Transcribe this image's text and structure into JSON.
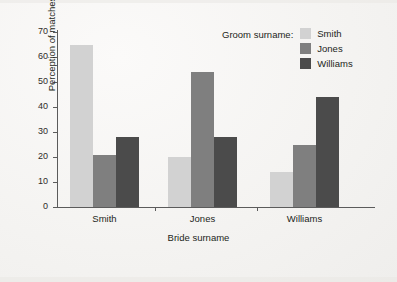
{
  "chart_data": {
    "type": "bar",
    "title": "",
    "xlabel": "Bride surname",
    "ylabel": "Perception of matches",
    "categories": [
      "Smith",
      "Jones",
      "Williams"
    ],
    "series": [
      {
        "name": "Smith",
        "values": [
          65,
          20,
          14
        ],
        "color": "#d2d2d2"
      },
      {
        "name": "Jones",
        "values": [
          21,
          54,
          25
        ],
        "color": "#7f7f7f"
      },
      {
        "name": "Williams",
        "values": [
          28,
          28,
          44
        ],
        "color": "#4b4b4b"
      }
    ],
    "ylim": [
      0,
      70
    ],
    "ytick_labels": [
      "70",
      "60",
      "50",
      "40",
      "30",
      "20",
      "10",
      "0"
    ],
    "ytick_values": [
      70,
      60,
      50,
      40,
      30,
      20,
      10,
      0
    ],
    "grid": false,
    "legend_position": "top-right",
    "legend_title": "Groom surname:"
  },
  "axes": {
    "y_title": "Perception of matches",
    "x_title": "Bride surname"
  },
  "legend": {
    "title": "Groom surname:",
    "entries": [
      {
        "label": "Smith",
        "color": "#d2d2d2"
      },
      {
        "label": "Jones",
        "color": "#7f7f7f"
      },
      {
        "label": "Williams",
        "color": "#4b4b4b"
      }
    ]
  },
  "colors": {
    "series_light": "#d2d2d2",
    "series_medium": "#7f7f7f",
    "series_dark": "#4b4b4b",
    "axis": "#5b5b5b",
    "text": "#231f20",
    "background": "#f4f3f1"
  }
}
